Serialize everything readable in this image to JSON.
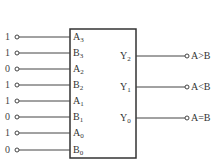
{
  "diagram": {
    "type": "4-bit magnitude comparator",
    "inputs": [
      {
        "pin": "A",
        "sub": "3",
        "value": "1"
      },
      {
        "pin": "B",
        "sub": "3",
        "value": "1"
      },
      {
        "pin": "A",
        "sub": "2",
        "value": "0"
      },
      {
        "pin": "B",
        "sub": "2",
        "value": "1"
      },
      {
        "pin": "A",
        "sub": "1",
        "value": "1"
      },
      {
        "pin": "B",
        "sub": "1",
        "value": "0"
      },
      {
        "pin": "A",
        "sub": "0",
        "value": "1"
      },
      {
        "pin": "B",
        "sub": "0",
        "value": "0"
      }
    ],
    "outputs": [
      {
        "pin": "Y",
        "sub": "2",
        "label": "A>B"
      },
      {
        "pin": "Y",
        "sub": "1",
        "label": "A<B"
      },
      {
        "pin": "Y",
        "sub": "0",
        "label": "A=B"
      }
    ],
    "colors": {
      "line": "#333333",
      "background": "#ffffff"
    }
  }
}
